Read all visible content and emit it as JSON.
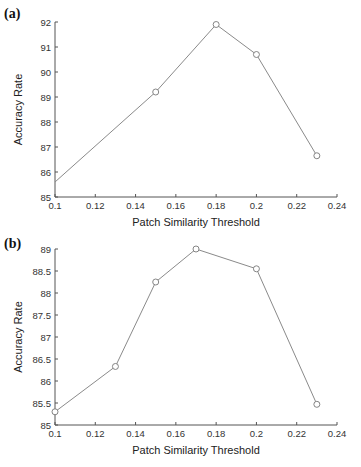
{
  "chart_data": [
    {
      "panel": "(a)",
      "type": "line",
      "title": "",
      "xlabel": "Patch Similarity Threshold",
      "ylabel": "Accuracy Rate",
      "xlim": [
        0.1,
        0.24
      ],
      "ylim": [
        85,
        92
      ],
      "xticks": [
        "0.1",
        "0.12",
        "0.14",
        "0.16",
        "0.18",
        "0.2",
        "0.22",
        "0.24"
      ],
      "yticks": [
        "85",
        "86",
        "87",
        "88",
        "89",
        "90",
        "91",
        "92"
      ],
      "grid": false,
      "marker": "circle",
      "line_color": "#8a8a8a",
      "x": [
        0.1,
        0.15,
        0.18,
        0.2,
        0.23
      ],
      "y": [
        85.6,
        89.2,
        91.9,
        90.7,
        86.65
      ],
      "markers_shown": [
        false,
        true,
        true,
        true,
        true
      ]
    },
    {
      "panel": "(b)",
      "type": "line",
      "title": "",
      "xlabel": "Patch Similarity Threshold",
      "ylabel": "Accuracy Rate",
      "xlim": [
        0.1,
        0.24
      ],
      "ylim": [
        85,
        89
      ],
      "xticks": [
        "0.1",
        "0.12",
        "0.14",
        "0.16",
        "0.18",
        "0.2",
        "0.22",
        "0.24"
      ],
      "yticks": [
        "85",
        "85.5",
        "86",
        "86.5",
        "87",
        "87.5",
        "88",
        "88.5",
        "89"
      ],
      "grid": false,
      "marker": "circle",
      "line_color": "#8a8a8a",
      "x": [
        0.1,
        0.13,
        0.15,
        0.17,
        0.2,
        0.23
      ],
      "y": [
        85.3,
        86.33,
        88.25,
        89.0,
        88.55,
        85.47
      ],
      "markers_shown": [
        true,
        true,
        true,
        true,
        true,
        true
      ]
    }
  ],
  "panels": [
    {
      "label": "(a)"
    },
    {
      "label": "(b)"
    }
  ]
}
